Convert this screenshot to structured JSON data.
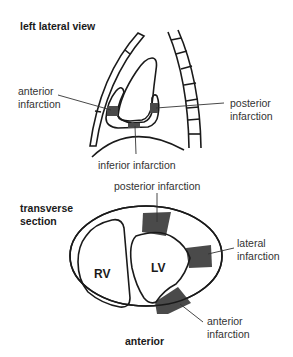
{
  "colors": {
    "outline": "#1a1a1a",
    "infarct": "#4a4a4a",
    "text": "#333333",
    "background": "#ffffff"
  },
  "lateral_view": {
    "title": "left lateral view",
    "labels": {
      "anterior_line1": "anterior",
      "anterior_line2": "infarction",
      "posterior_line1": "posterior",
      "posterior_line2": "infarction",
      "inferior": "inferior infarction"
    }
  },
  "transverse_section": {
    "title_line1": "transverse",
    "title_line2": "section",
    "chambers": {
      "rv": "RV",
      "lv": "LV"
    },
    "labels": {
      "posterior": "posterior infarction",
      "lateral_line1": "lateral",
      "lateral_line2": "infarction",
      "anterior_line1": "anterior",
      "anterior_line2": "infarction"
    },
    "orientation": "anterior"
  }
}
